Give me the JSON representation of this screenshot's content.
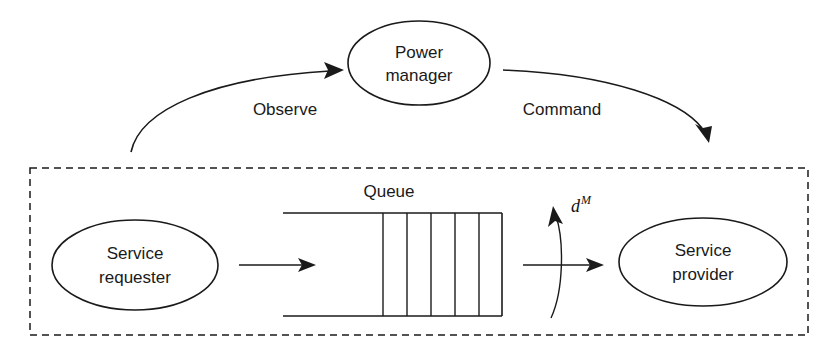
{
  "diagram": {
    "nodes": [
      {
        "id": "power-manager",
        "label_line1": "Power",
        "label_line2": "manager"
      },
      {
        "id": "service-requester",
        "label_line1": "Service",
        "label_line2": "requester"
      },
      {
        "id": "service-provider",
        "label_line1": "Service",
        "label_line2": "provider"
      }
    ],
    "labels": {
      "observe": "Observe",
      "command": "Command",
      "queue": "Queue",
      "decision_var": "d",
      "decision_sup": "M"
    },
    "queue": {
      "slot_count": 5,
      "divider_count": 6
    },
    "colors": {
      "stroke": "#1a1a1a",
      "background": "#ffffff",
      "text": "#1a1a1a"
    }
  }
}
